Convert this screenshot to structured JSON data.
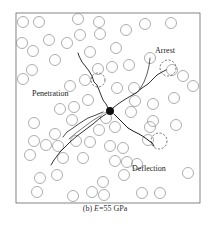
{
  "figure": {
    "caption_prefix": "(b) ",
    "caption_var": "E",
    "caption_suffix": "=55 GPa",
    "labels": {
      "arrest": "Arrest",
      "penetration": "Penetration",
      "deflection": "Deflection"
    },
    "colors": {
      "frame": "#666666",
      "particle": "#8a8a8a",
      "crack": "#1a1a1a",
      "dashed": "#555555",
      "background": "#ffffff"
    },
    "frame": {
      "x": 16,
      "y": 13,
      "w": 184,
      "h": 190
    },
    "particles": [
      [
        23,
        22
      ],
      [
        39,
        22
      ],
      [
        78,
        19
      ],
      [
        99,
        22
      ],
      [
        145,
        24
      ],
      [
        171,
        23
      ],
      [
        80,
        35
      ],
      [
        100,
        34
      ],
      [
        126,
        30
      ],
      [
        22,
        43
      ],
      [
        49,
        40
      ],
      [
        67,
        43
      ],
      [
        33,
        51
      ],
      [
        90,
        52
      ],
      [
        116,
        48
      ],
      [
        55,
        60
      ],
      [
        98,
        69
      ],
      [
        112,
        67
      ],
      [
        129,
        65
      ],
      [
        150,
        58
      ],
      [
        32,
        70
      ],
      [
        23,
        79
      ],
      [
        70,
        86
      ],
      [
        85,
        80
      ],
      [
        172,
        70
      ],
      [
        183,
        76
      ],
      [
        193,
        86
      ],
      [
        117,
        88
      ],
      [
        134,
        88
      ],
      [
        135,
        101
      ],
      [
        174,
        98
      ],
      [
        153,
        104
      ],
      [
        60,
        109
      ],
      [
        88,
        100
      ],
      [
        74,
        107
      ],
      [
        106,
        118
      ],
      [
        153,
        121
      ],
      [
        131,
        112
      ],
      [
        34,
        123
      ],
      [
        72,
        120
      ],
      [
        176,
        125
      ],
      [
        55,
        134
      ],
      [
        115,
        127
      ],
      [
        150,
        127
      ],
      [
        34,
        141
      ],
      [
        46,
        145
      ],
      [
        58,
        146
      ],
      [
        76,
        141
      ],
      [
        90,
        142
      ],
      [
        99,
        130
      ],
      [
        110,
        146
      ],
      [
        123,
        148
      ],
      [
        148,
        140
      ],
      [
        30,
        155
      ],
      [
        63,
        158
      ],
      [
        83,
        158
      ],
      [
        115,
        161
      ],
      [
        127,
        162
      ],
      [
        137,
        164
      ],
      [
        40,
        178
      ],
      [
        57,
        175
      ],
      [
        103,
        182
      ],
      [
        124,
        175
      ],
      [
        188,
        173
      ],
      [
        37,
        192
      ],
      [
        73,
        196
      ],
      [
        92,
        192
      ],
      [
        104,
        195
      ],
      [
        142,
        193
      ],
      [
        160,
        193
      ],
      [
        107,
        210
      ]
    ],
    "dashed_circles": [
      {
        "name": "arrest-particle",
        "x": 168,
        "y": 68,
        "r": 8
      },
      {
        "name": "penetration-particle",
        "x": 98,
        "y": 80,
        "r": 7
      },
      {
        "name": "deflection-particle",
        "x": 159,
        "y": 141,
        "r": 8
      }
    ]
  }
}
